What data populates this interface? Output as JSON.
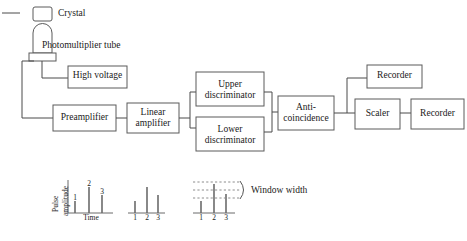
{
  "diagram": {
    "components": {
      "crystal": "Crystal",
      "pmt": "Photomultiplier tube",
      "high_voltage": "High voltage",
      "preamplifier": "Preamplifier",
      "linear_amplifier_line1": "Linear",
      "linear_amplifier_line2": "amplifier",
      "upper_discriminator_line1": "Upper",
      "upper_discriminator_line2": "discriminator",
      "lower_discriminator_line1": "Lower",
      "lower_discriminator_line2": "discriminator",
      "anticoincidence_line1": "Anti-",
      "anticoincidence_line2": "coincidence",
      "scaler": "Scaler",
      "recorder_top": "Recorder",
      "recorder_right": "Recorder"
    },
    "plots": {
      "amplitude_axis_line1": "Pulse",
      "amplitude_axis_line2": "amplitude",
      "time_axis": "Time",
      "window_width": "Window width",
      "pulse_labels": [
        "1",
        "2",
        "3"
      ],
      "left_plot_heights": [
        12,
        26,
        18
      ],
      "middle_plot_heights": [
        12,
        26,
        18
      ],
      "right_plot_heights": [
        12,
        26,
        18
      ],
      "window_levels": [
        3,
        3
      ]
    },
    "colors": {
      "stroke": "#5a5a5a",
      "wire": "#4a4a4a",
      "text": "#1a1a1a",
      "background": "#ffffff",
      "dash": "#8c8c8c"
    }
  }
}
